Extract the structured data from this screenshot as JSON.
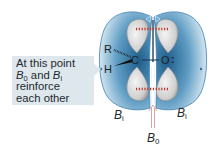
{
  "callout": {
    "line1": "At this point",
    "line2_prefix": "B",
    "line2_sub1": "0",
    "line2_mid": " and ",
    "line2_b": "B",
    "line2_sub2": "i",
    "line3": "reinforce",
    "line4": "each other"
  },
  "labels": {
    "bi_left": "B",
    "bi_left_sub": "i",
    "bi_right": "B",
    "bi_right_sub": "i",
    "b0": "B",
    "b0_sub": "0"
  },
  "atoms": {
    "r": "R",
    "h": "H",
    "c": "C",
    "o": "O",
    "lone_pairs": ":"
  },
  "colors": {
    "field_dark": "#2f6f99",
    "field_light": "#cfe3ee",
    "field_outline": "#3b7fb0",
    "orbital": "#d8d8d8",
    "orbital_edge": "#9a9a9a",
    "dash_red": "#c0392b",
    "b0_arrow": "#d99a9a",
    "callout_bg": "#dde7ec"
  }
}
